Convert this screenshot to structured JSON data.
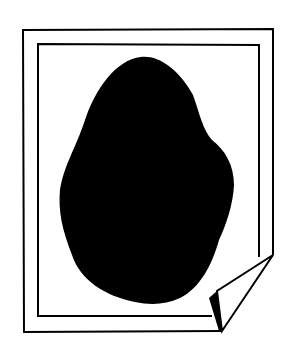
{
  "illustration": {
    "subject": "photo-print-with-curled-corner",
    "colors": {
      "background": "#ffffff",
      "ink": "#000000",
      "blob": "#000000"
    }
  }
}
